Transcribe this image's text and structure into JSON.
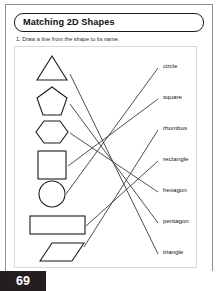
{
  "worksheet": {
    "title": "Matching 2D Shapes",
    "instruction": "1. Draw a line from the shape to its name.",
    "page_number": "69",
    "ink_color": "#1b1b1b",
    "line_color": "#3a3a3a",
    "page_tab_color": "#231f20"
  },
  "shapes": [
    {
      "name": "triangle",
      "icon": "triangle-shape",
      "cx": 52,
      "cy": 68,
      "anchor_x": 70,
      "anchor_y": 74
    },
    {
      "name": "pentagon",
      "icon": "pentagon-shape",
      "cx": 52,
      "cy": 100,
      "anchor_x": 70,
      "anchor_y": 104
    },
    {
      "name": "hexagon",
      "icon": "hexagon-shape",
      "cx": 52,
      "cy": 131,
      "anchor_x": 70,
      "anchor_y": 133
    },
    {
      "name": "square",
      "icon": "square-shape",
      "cx": 52,
      "cy": 163,
      "anchor_x": 68,
      "anchor_y": 166
    },
    {
      "name": "circle",
      "icon": "circle-shape",
      "cx": 52,
      "cy": 194,
      "anchor_x": 66,
      "anchor_y": 194
    },
    {
      "name": "rectangle",
      "icon": "rectangle-shape",
      "cx": 56,
      "cy": 224,
      "anchor_x": 86,
      "anchor_y": 226
    },
    {
      "name": "rhombus",
      "icon": "rhombus-shape",
      "cx": 56,
      "cy": 252,
      "anchor_x": 84,
      "anchor_y": 247
    }
  ],
  "labels": [
    {
      "text": "circle",
      "x": 163,
      "y": 66,
      "anchor_x": 158,
      "anchor_y": 68
    },
    {
      "text": "square",
      "x": 163,
      "y": 97,
      "anchor_x": 158,
      "anchor_y": 99
    },
    {
      "text": "rhombus",
      "x": 163,
      "y": 128,
      "anchor_x": 158,
      "anchor_y": 130
    },
    {
      "text": "rectangle",
      "x": 163,
      "y": 159,
      "anchor_x": 158,
      "anchor_y": 161
    },
    {
      "text": "hexagon",
      "x": 163,
      "y": 190,
      "anchor_x": 158,
      "anchor_y": 192
    },
    {
      "text": "pentagon",
      "x": 163,
      "y": 221,
      "anchor_x": 158,
      "anchor_y": 223
    },
    {
      "text": "triangle",
      "x": 163,
      "y": 252,
      "anchor_x": 158,
      "anchor_y": 254
    }
  ],
  "connections": [
    {
      "from": "triangle",
      "to": "triangle",
      "x1": 70,
      "y1": 74,
      "x2": 158,
      "y2": 254
    },
    {
      "from": "pentagon",
      "to": "pentagon",
      "x1": 70,
      "y1": 104,
      "x2": 158,
      "y2": 223
    },
    {
      "from": "hexagon",
      "to": "hexagon",
      "x1": 70,
      "y1": 133,
      "x2": 158,
      "y2": 192
    },
    {
      "from": "square",
      "to": "square",
      "x1": 68,
      "y1": 166,
      "x2": 158,
      "y2": 99
    },
    {
      "from": "circle",
      "to": "circle",
      "x1": 66,
      "y1": 194,
      "x2": 158,
      "y2": 68
    },
    {
      "from": "rectangle",
      "to": "rectangle",
      "x1": 86,
      "y1": 226,
      "x2": 158,
      "y2": 161
    },
    {
      "from": "rhombus",
      "to": "rhombus",
      "x1": 84,
      "y1": 247,
      "x2": 158,
      "y2": 130
    }
  ]
}
